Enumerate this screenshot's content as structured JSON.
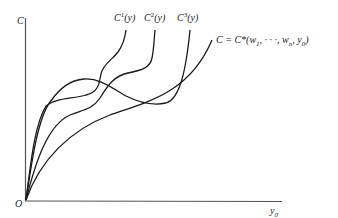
{
  "diagram": {
    "axes": {
      "y_label": "C",
      "x_label": "y",
      "x_label_sub": "0",
      "origin_label": "O"
    },
    "curves": [
      {
        "id": "C1",
        "label_base": "C",
        "label_sup": "1",
        "label_arg": "(y)"
      },
      {
        "id": "C2",
        "label_base": "C",
        "label_sup": "2",
        "label_arg": "(y)"
      },
      {
        "id": "C3",
        "label_base": "C",
        "label_sup": "3",
        "label_arg": "(y)"
      },
      {
        "id": "Cstar",
        "label": "C = C*(w",
        "label_sub1": "1",
        "label_mid": ", · · ·, w",
        "label_sub2": "n",
        "label_mid2": ", y",
        "label_sub3": "0",
        "label_end": ")"
      }
    ],
    "colors": {
      "line": "#1a1a1a",
      "axis": "#555555",
      "background": "#ffffff"
    }
  }
}
